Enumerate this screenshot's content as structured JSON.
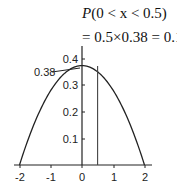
{
  "annotation": {
    "line1_prefix": "P",
    "line1_rest": "(0 < x < 0.5)",
    "line2": "= 0.5×0.38 = 0.19",
    "callout_label": "0.38"
  },
  "chart_data": {
    "type": "line",
    "title": "",
    "xlabel": "",
    "ylabel": "",
    "function": "f(x) = 0.375 - 0.09375 x^2 (parabolic density on [-2, 2])",
    "x": [
      -2,
      -1.5,
      -1,
      -0.5,
      0,
      0.5,
      1,
      1.5,
      2
    ],
    "values": [
      0,
      0.164,
      0.281,
      0.352,
      0.375,
      0.352,
      0.281,
      0.164,
      0
    ],
    "xlim": [
      -2,
      2
    ],
    "ylim": [
      0,
      0.4
    ],
    "x_ticks": [
      "-2",
      "-1",
      "0",
      "1",
      "2"
    ],
    "y_ticks": [
      "0.1",
      "0.2",
      "0.3",
      "0.4"
    ],
    "annotations": [
      {
        "text": "0.38",
        "x": 0,
        "y": 0.38,
        "type": "callout"
      },
      {
        "type": "vertical-line",
        "x": 0.5
      },
      {
        "text": "P(0 < x < 0.5) = 0.5×0.38 = 0.19"
      }
    ],
    "grid": false,
    "legend": "none"
  }
}
